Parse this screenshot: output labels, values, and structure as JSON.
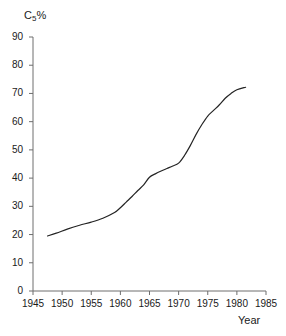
{
  "chart_data": {
    "type": "line",
    "title": "",
    "subtitle": "",
    "ylabel": "C5%",
    "ylabel_base": "C",
    "ylabel_sub": "5",
    "ylabel_unit": "%",
    "xlabel": "Year",
    "xlim": [
      1945,
      1985
    ],
    "ylim": [
      0,
      90
    ],
    "xticks": [
      1945,
      1950,
      1955,
      1960,
      1965,
      1970,
      1975,
      1980,
      1985
    ],
    "yticks": [
      0,
      10,
      20,
      30,
      40,
      50,
      60,
      70,
      80,
      90
    ],
    "xtick_labels": [
      "1945",
      "1950",
      "1955",
      "1960",
      "1965",
      "1970",
      "1975",
      "1980",
      "1985"
    ],
    "ytick_labels": [
      "0",
      "10",
      "20",
      "30",
      "40",
      "50",
      "60",
      "70",
      "80",
      "90"
    ],
    "grid": false,
    "legend": false,
    "legend_position": "none",
    "line_color": "#242424",
    "line_width": 1.2,
    "axis_color": "#6e6e6e",
    "background": "#ffffff",
    "series": [
      {
        "name": "C5%",
        "x": [
          1947.5,
          1949,
          1951,
          1953,
          1955,
          1957,
          1959,
          1960,
          1961,
          1962,
          1963,
          1964,
          1965,
          1966,
          1967,
          1968,
          1969,
          1970,
          1971,
          1972,
          1973,
          1974,
          1975,
          1976,
          1977,
          1978,
          1979,
          1980,
          1981.5
        ],
        "values": [
          19.5,
          20.5,
          22.0,
          23.3,
          24.4,
          25.8,
          27.8,
          29.5,
          31.5,
          33.5,
          35.6,
          37.6,
          40.3,
          41.5,
          42.5,
          43.4,
          44.3,
          45.3,
          48.0,
          51.5,
          55.5,
          59.0,
          62.0,
          64.0,
          66.0,
          68.3,
          70.0,
          71.3,
          72.2
        ]
      }
    ]
  },
  "axes": {
    "y_axis_name": "c5-percent-axis",
    "x_axis_name": "year-axis"
  }
}
